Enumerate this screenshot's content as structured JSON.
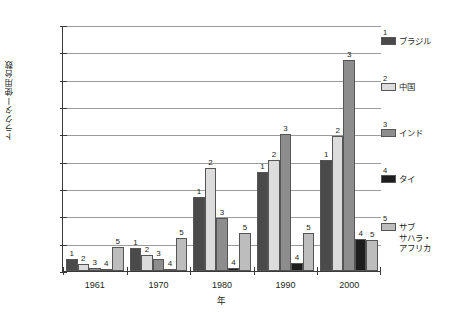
{
  "chart_data": {
    "type": "bar",
    "title": "",
    "xlabel": "年",
    "ylabel": "トラクター使用台数",
    "categories": [
      "1961",
      "1970",
      "1980",
      "1990",
      "2000"
    ],
    "ylim": [
      0,
      1800
    ],
    "ytick_step": 200,
    "ytick_labels": [
      "0",
      "200",
      "400",
      "600",
      "800",
      "1 000",
      "1 200",
      "1 400",
      "1 600",
      "1 800"
    ],
    "ytick_values": [
      0,
      200,
      400,
      600,
      800,
      1000,
      1200,
      1400,
      1600,
      1800
    ],
    "grid": true,
    "legend_position": "right",
    "series": [
      {
        "key": "1",
        "name": "ブラジル",
        "color": "#4a4a4a",
        "values": [
          85,
          165,
          545,
          725,
          815
        ]
      },
      {
        "key": "2",
        "name": "中国",
        "color": "#dcdcdc",
        "values": [
          50,
          120,
          755,
          815,
          985
        ]
      },
      {
        "key": "3",
        "name": "インド",
        "color": "#8d8d8d",
        "values": [
          25,
          90,
          390,
          1000,
          1545
        ]
      },
      {
        "key": "4",
        "name": "タイ",
        "color": "#1d1d1d",
        "values": [
          5,
          15,
          20,
          55,
          235
        ]
      },
      {
        "key": "5",
        "name": "サブ\nサハラ・\nアフリカ",
        "color": "#bdbdbd",
        "values": [
          175,
          240,
          275,
          275,
          230
        ]
      }
    ],
    "point_labels": {
      "1961": [
        "1",
        "2",
        "3",
        "4",
        "5"
      ],
      "1970": [
        "1",
        "2",
        "3",
        "4",
        "5"
      ],
      "1980": [
        "1",
        "2",
        "3",
        "4",
        "5"
      ],
      "1990": [
        "1",
        "2",
        "3",
        "4",
        "5"
      ],
      "2000": [
        "1",
        "2",
        "3",
        "4",
        "5"
      ]
    }
  }
}
